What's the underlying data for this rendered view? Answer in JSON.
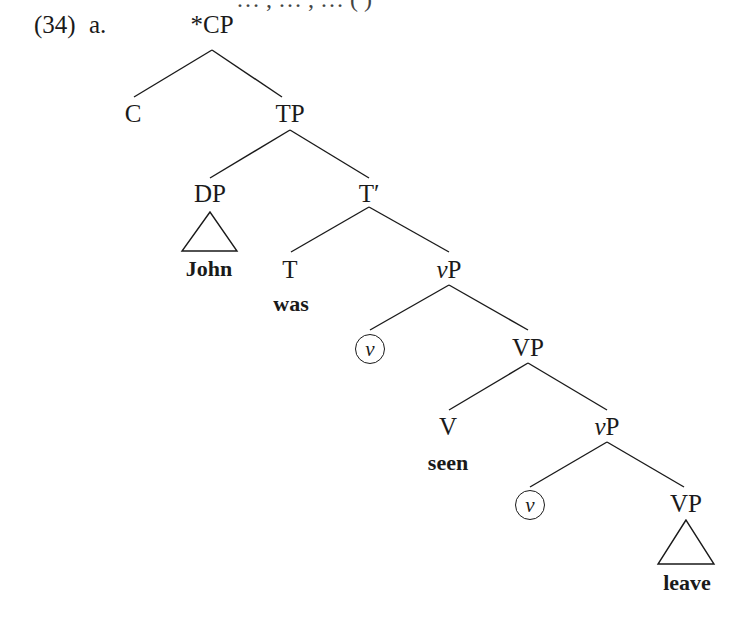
{
  "header_fragment": "… , … , … (  )",
  "example": {
    "number": "(34)",
    "sub": "a."
  },
  "nodes": {
    "root": {
      "star": "*",
      "label": "CP"
    },
    "c": "C",
    "tp": "TP",
    "dp": "DP",
    "john": "John",
    "tbar": "T′",
    "t": "T",
    "was": "was",
    "vp1": {
      "italic": "v",
      "rest": "P"
    },
    "vhead1": "v",
    "VP1": "VP",
    "V": "V",
    "seen": "seen",
    "vp2": {
      "italic": "v",
      "rest": "P"
    },
    "vhead2": "v",
    "VP2": "VP",
    "leave": "leave"
  }
}
